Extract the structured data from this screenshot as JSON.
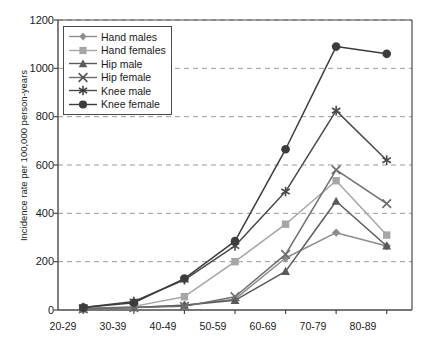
{
  "chart_data": {
    "type": "line",
    "title": "",
    "xlabel": "",
    "ylabel": "Incidence rate per 100,000 person-years",
    "categories": [
      "20-29",
      "30-39",
      "40-49",
      "50-59",
      "60-69",
      "70-79",
      "80-89"
    ],
    "ylim": [
      0,
      1200
    ],
    "yticks": [
      0,
      200,
      400,
      600,
      800,
      1000,
      1200
    ],
    "grid": "horizontal-dashed",
    "legend_position": "top-left-inside",
    "series": [
      {
        "name": "Hand males",
        "marker": "diamond",
        "color": "#8c8c8c",
        "values": [
          5,
          10,
          20,
          45,
          215,
          320,
          265
        ]
      },
      {
        "name": "Hand females",
        "marker": "square",
        "color": "#a6a6a6",
        "values": [
          5,
          15,
          55,
          200,
          355,
          535,
          310
        ]
      },
      {
        "name": "Hip male",
        "marker": "triangle",
        "color": "#5a5a5a",
        "values": [
          5,
          10,
          20,
          40,
          160,
          450,
          265
        ]
      },
      {
        "name": "Hip female",
        "marker": "x",
        "color": "#6e6e6e",
        "values": [
          5,
          10,
          15,
          55,
          230,
          580,
          440
        ]
      },
      {
        "name": "Knee male",
        "marker": "asterisk",
        "color": "#4a4a4a",
        "values": [
          10,
          35,
          125,
          265,
          490,
          825,
          620
        ]
      },
      {
        "name": "Knee female",
        "marker": "circle",
        "color": "#3c3c3c",
        "values": [
          10,
          30,
          130,
          285,
          665,
          1090,
          1060
        ]
      }
    ]
  },
  "axis": {
    "y_tick_labels": [
      "1200",
      "1000",
      "800",
      "600",
      "400",
      "200",
      "0"
    ],
    "y_label_text": "Incidence rate per 100,000 person-years",
    "x_tick_labels": [
      "20-29",
      "30-39",
      "40-49",
      "50-59",
      "60-69",
      "70-79",
      "80-89"
    ]
  },
  "legend": {
    "items": [
      {
        "label": "Hand males"
      },
      {
        "label": "Hand females"
      },
      {
        "label": "Hip male"
      },
      {
        "label": "Hip female"
      },
      {
        "label": "Knee male"
      },
      {
        "label": "Knee female"
      }
    ]
  },
  "colors": {
    "axis": "#4a4a4a",
    "grid": "#9a9a9a",
    "text": "#1a1a1a",
    "background": "#ffffff"
  }
}
